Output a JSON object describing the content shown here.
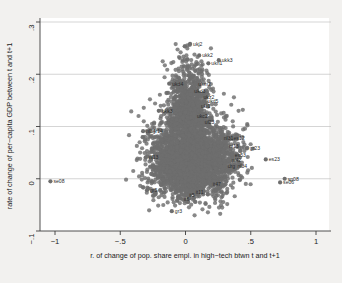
{
  "chart_data": {
    "type": "scatter",
    "title": "",
    "xlabel": "r. of change of pop. share empl. in high−tech btwn t and t+1",
    "ylabel": "rate of change of per−capita GDP between t and t+1",
    "xlim": [
      -1.15,
      1.0
    ],
    "ylim": [
      -0.115,
      0.305
    ],
    "xticks": [
      -1,
      -0.5,
      0,
      0.5,
      1
    ],
    "xtick_labels": [
      "−1",
      "−.5",
      "0",
      ".5",
      "1"
    ],
    "yticks": [
      -0.1,
      0,
      0.1,
      0.2,
      0.3
    ],
    "ytick_labels": [
      "−.1",
      "0",
      ".1",
      ".2",
      ".3"
    ],
    "grid": "horizontal",
    "legend": "none",
    "marker_color": "#6e6e6e",
    "marker_size": 2.1,
    "labeled_points": [
      {
        "label": "ukj2",
        "x": 0.035,
        "y": 0.258
      },
      {
        "label": "ukk2",
        "x": 0.105,
        "y": 0.236
      },
      {
        "label": "ukk3",
        "x": 0.255,
        "y": 0.227
      },
      {
        "label": "ukn1",
        "x": 0.175,
        "y": 0.221
      },
      {
        "label": "ukd4",
        "x": -0.125,
        "y": 0.182
      },
      {
        "label": "ukm2",
        "x": 0.075,
        "y": 0.181
      },
      {
        "label": "ukd3",
        "x": 0.045,
        "y": 0.168
      },
      {
        "label": "ukz2",
        "x": 0.115,
        "y": 0.157
      },
      {
        "label": "ukd5",
        "x": 0.145,
        "y": 0.149
      },
      {
        "label": "ukl1",
        "x": 0.095,
        "y": 0.139
      },
      {
        "label": "ukk3",
        "x": -0.205,
        "y": 0.13
      },
      {
        "label": "ukc2",
        "x": 0.065,
        "y": 0.12
      },
      {
        "label": "ul23",
        "x": 0.125,
        "y": 0.108
      },
      {
        "label": "nl34",
        "x": -0.325,
        "y": 0.091
      },
      {
        "label": "gr14",
        "x": -0.275,
        "y": 0.091
      },
      {
        "label": "nl31",
        "x": 0.27,
        "y": 0.078
      },
      {
        "label": "es12",
        "x": 0.345,
        "y": 0.077
      },
      {
        "label": "nl13",
        "x": 0.31,
        "y": 0.063
      },
      {
        "label": "gr23",
        "x": 0.47,
        "y": 0.058
      },
      {
        "label": "es53",
        "x": 0.355,
        "y": 0.046
      },
      {
        "label": "nl13",
        "x": -0.305,
        "y": 0.041
      },
      {
        "label": "es23",
        "x": 0.615,
        "y": 0.037
      },
      {
        "label": "nl42",
        "x": 0.33,
        "y": 0.036
      },
      {
        "label": "nl34",
        "x": 0.375,
        "y": 0.025
      },
      {
        "label": "drg",
        "x": 0.3,
        "y": 0.024
      },
      {
        "label": "se08",
        "x": -1.035,
        "y": -0.005
      },
      {
        "label": "sp08",
        "x": 0.76,
        "y": 0.0
      },
      {
        "label": "se06",
        "x": 0.725,
        "y": -0.007
      },
      {
        "label": "it47",
        "x": 0.185,
        "y": -0.01
      },
      {
        "label": "gr5",
        "x": -0.295,
        "y": -0.022
      },
      {
        "label": "it11",
        "x": 0.055,
        "y": -0.026
      },
      {
        "label": "it5",
        "x": 0.005,
        "y": -0.032
      },
      {
        "label": "it6",
        "x": -0.035,
        "y": -0.038
      },
      {
        "label": "gr3",
        "x": -0.105,
        "y": -0.062
      }
    ]
  },
  "figure": {
    "plot_left_px": 40,
    "plot_right_px": 329,
    "plot_top_px": 22,
    "plot_bottom_px": 231
  }
}
